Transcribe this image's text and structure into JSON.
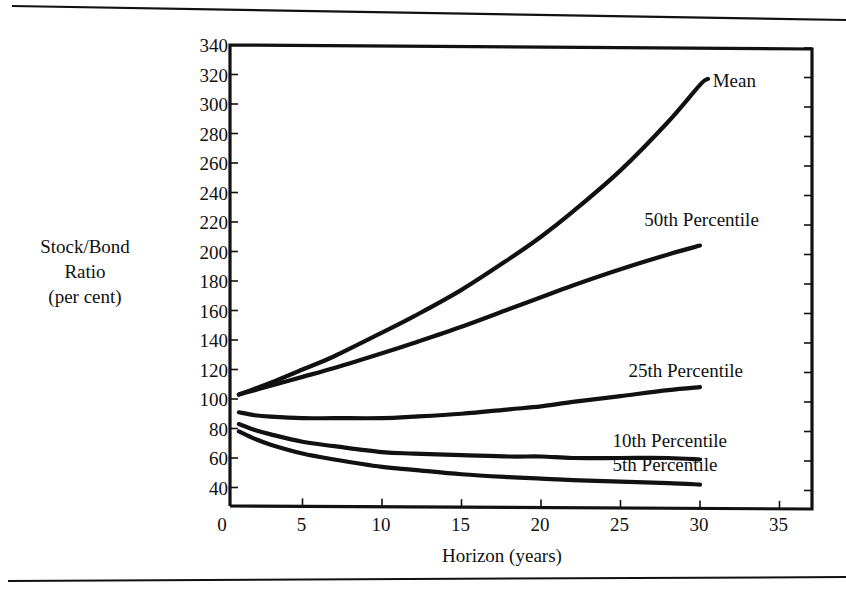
{
  "chart_data": {
    "type": "line",
    "title": "",
    "xlabel": "Horizon (years)",
    "ylabel": [
      "Stock/Bond",
      "Ratio",
      "(per cent)"
    ],
    "xlim": [
      0,
      37
    ],
    "ylim": [
      27,
      340
    ],
    "x_ticks": [
      0,
      5,
      10,
      15,
      20,
      25,
      30,
      35
    ],
    "y_ticks": [
      40,
      60,
      80,
      100,
      120,
      140,
      160,
      180,
      200,
      220,
      240,
      260,
      280,
      300,
      320,
      340
    ],
    "grid": false,
    "legend_position": "inline labels at right end of each line",
    "x": [
      1,
      2,
      3,
      5,
      7,
      10,
      12,
      15,
      18,
      20,
      22,
      25,
      28,
      30
    ],
    "series": [
      {
        "name": "Mean",
        "label_pos": [
          30.8,
          316
        ],
        "values": [
          103,
          107,
          111,
          120,
          129,
          145,
          156,
          174,
          195,
          210,
          227,
          255,
          288,
          313
        ]
      },
      {
        "name": "50th Percentile",
        "label_pos": [
          26.5,
          222
        ],
        "values": [
          103,
          106,
          109,
          115,
          121,
          131,
          138,
          149,
          161,
          169,
          177,
          188,
          198,
          204
        ]
      },
      {
        "name": "25th Percentile",
        "label_pos": [
          25.5,
          120
        ],
        "values": [
          91,
          89,
          88,
          87,
          87,
          87,
          88,
          90,
          93,
          95,
          98,
          102,
          106,
          108
        ]
      },
      {
        "name": "10th Percentile",
        "label_pos": [
          24.5,
          72
        ],
        "values": [
          83,
          79,
          76,
          71,
          68,
          64,
          63,
          62,
          61,
          61,
          60,
          60,
          60,
          59
        ]
      },
      {
        "name": "5th Percentile",
        "label_pos": [
          24.5,
          56
        ],
        "values": [
          78,
          73,
          69,
          63,
          59,
          54,
          52,
          49,
          47,
          46,
          45,
          44,
          43,
          42
        ]
      }
    ]
  },
  "page": {
    "top_rule": true,
    "bottom_rule": true
  }
}
